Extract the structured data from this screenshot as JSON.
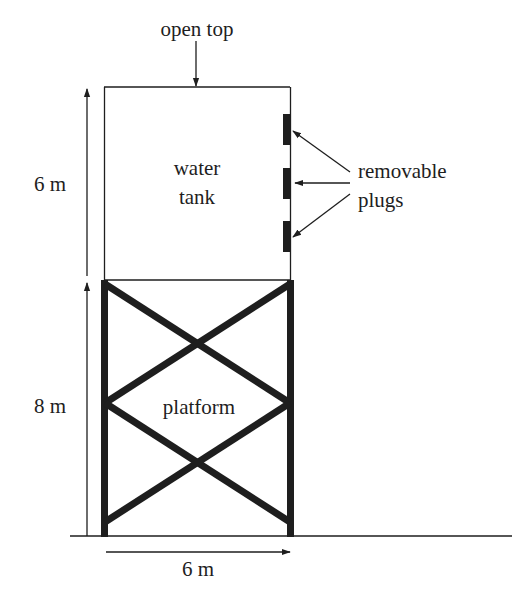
{
  "labels": {
    "open_top": "open top",
    "tank_line1": "water",
    "tank_line2": "tank",
    "plugs_line1": "removable",
    "plugs_line2": "plugs",
    "platform": "platform",
    "tank_height": "6 m",
    "platform_height": "8 m",
    "width": "6 m"
  },
  "colors": {
    "ink": "#1e1e1e",
    "background": "#ffffff"
  },
  "dimensions": {
    "tank_height_m": 6,
    "platform_height_m": 8,
    "width_m": 6,
    "plug_count": 3
  }
}
